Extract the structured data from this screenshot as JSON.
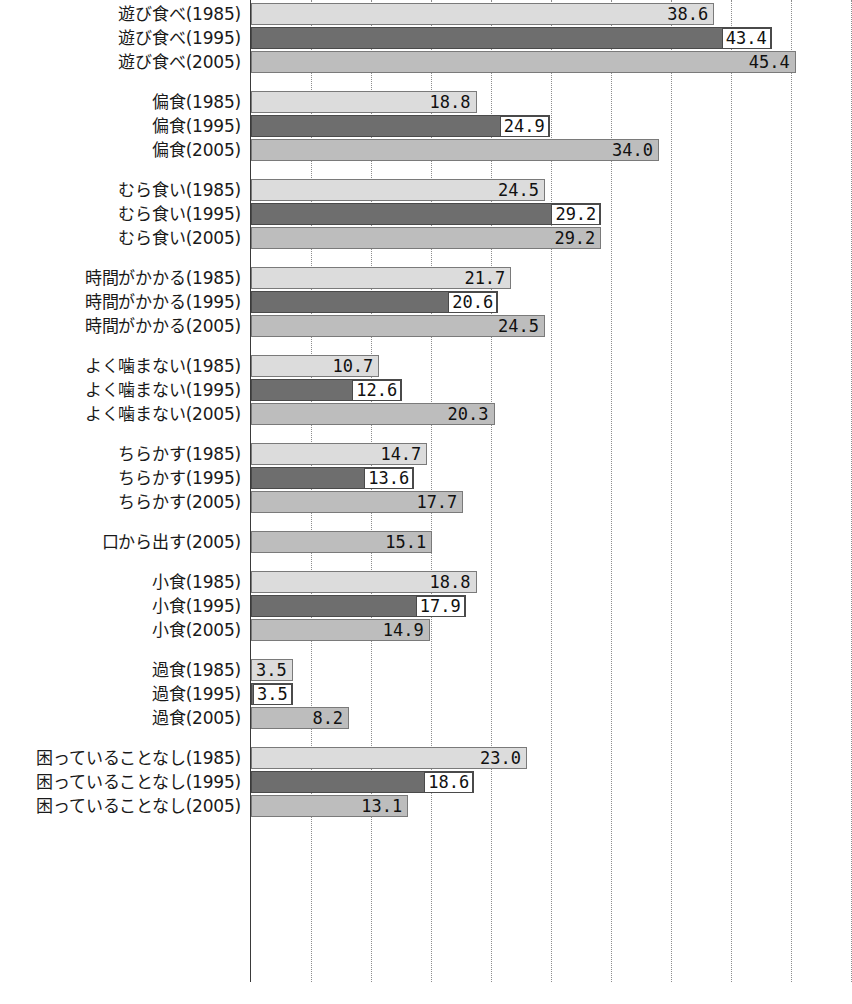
{
  "chart_data": {
    "type": "bar",
    "orientation": "horizontal",
    "title": "",
    "xlabel": "",
    "ylabel": "",
    "xlim": [
      0,
      50
    ],
    "grid": true,
    "grid_interval": 5,
    "grid_axis": "x",
    "legend": [],
    "value_format": "one-decimal",
    "series": [
      {
        "name": "1985",
        "color": "#dcdcdc"
      },
      {
        "name": "1995",
        "color": "#6e6e6e"
      },
      {
        "name": "2005",
        "color": "#bdbdbd"
      }
    ],
    "groups": [
      {
        "name": "遊び食べ",
        "bars": [
          {
            "label": "遊び食べ(1985)",
            "year": "1985",
            "value": 38.6
          },
          {
            "label": "遊び食べ(1995)",
            "year": "1995",
            "value": 43.4
          },
          {
            "label": "遊び食べ(2005)",
            "year": "2005",
            "value": 45.4
          }
        ]
      },
      {
        "name": "偏食",
        "bars": [
          {
            "label": "偏食(1985)",
            "year": "1985",
            "value": 18.8
          },
          {
            "label": "偏食(1995)",
            "year": "1995",
            "value": 24.9
          },
          {
            "label": "偏食(2005)",
            "year": "2005",
            "value": 34.0
          }
        ]
      },
      {
        "name": "むら食い",
        "bars": [
          {
            "label": "むら食い(1985)",
            "year": "1985",
            "value": 24.5
          },
          {
            "label": "むら食い(1995)",
            "year": "1995",
            "value": 29.2
          },
          {
            "label": "むら食い(2005)",
            "year": "2005",
            "value": 29.2
          }
        ]
      },
      {
        "name": "時間がかかる",
        "bars": [
          {
            "label": "時間がかかる(1985)",
            "year": "1985",
            "value": 21.7
          },
          {
            "label": "時間がかかる(1995)",
            "year": "1995",
            "value": 20.6
          },
          {
            "label": "時間がかかる(2005)",
            "year": "2005",
            "value": 24.5
          }
        ]
      },
      {
        "name": "よく噛まない",
        "bars": [
          {
            "label": "よく噛まない(1985)",
            "year": "1985",
            "value": 10.7
          },
          {
            "label": "よく噛まない(1995)",
            "year": "1995",
            "value": 12.6
          },
          {
            "label": "よく噛まない(2005)",
            "year": "2005",
            "value": 20.3
          }
        ]
      },
      {
        "name": "ちらかす",
        "bars": [
          {
            "label": "ちらかす(1985)",
            "year": "1985",
            "value": 14.7
          },
          {
            "label": "ちらかす(1995)",
            "year": "1995",
            "value": 13.6
          },
          {
            "label": "ちらかす(2005)",
            "year": "2005",
            "value": 17.7
          }
        ]
      },
      {
        "name": "口から出す",
        "bars": [
          {
            "label": "口から出す(2005)",
            "year": "2005",
            "value": 15.1
          }
        ]
      },
      {
        "name": "小食",
        "bars": [
          {
            "label": "小食(1985)",
            "year": "1985",
            "value": 18.8
          },
          {
            "label": "小食(1995)",
            "year": "1995",
            "value": 17.9
          },
          {
            "label": "小食(2005)",
            "year": "2005",
            "value": 14.9
          }
        ]
      },
      {
        "name": "過食",
        "bars": [
          {
            "label": "過食(1985)",
            "year": "1985",
            "value": 3.5
          },
          {
            "label": "過食(1995)",
            "year": "1995",
            "value": 3.5
          },
          {
            "label": "過食(2005)",
            "year": "2005",
            "value": 8.2
          }
        ]
      },
      {
        "name": "困っていることなし",
        "bars": [
          {
            "label": "困っていることなし(1985)",
            "year": "1985",
            "value": 23.0
          },
          {
            "label": "困っていることなし(1995)",
            "year": "1995",
            "value": 18.6
          },
          {
            "label": "困っていることなし(2005)",
            "year": "2005",
            "value": 13.1
          }
        ]
      }
    ]
  },
  "footer": {
    "cut_off_note": ""
  }
}
